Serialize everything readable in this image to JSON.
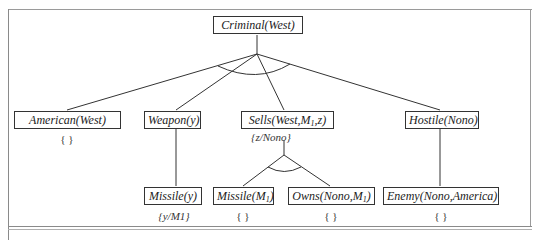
{
  "diagram": {
    "type": "proof-tree",
    "root": {
      "label": "Criminal(West)"
    },
    "level1": [
      {
        "label": "American(West)",
        "substitution": "{ }"
      },
      {
        "label": "Weapon(y)",
        "substitution": ""
      },
      {
        "label_main": "Sells(West,M",
        "label_sub": "1",
        "label_tail": ",z)",
        "substitution": "{z/Nono}"
      },
      {
        "label": "Hostile(Nono)",
        "substitution": ""
      }
    ],
    "level2": [
      {
        "parent": "Weapon(y)",
        "label": "Missile(y)",
        "substitution": "{y/M1}"
      },
      {
        "parent": "Sells(West,M1,z)",
        "label_main": "Missile(M",
        "label_sub": "1",
        "label_tail": ")",
        "substitution": "{ }"
      },
      {
        "parent": "Sells(West,M1,z)",
        "label_main": "Owns(Nono,M",
        "label_sub": "1",
        "label_tail": ")",
        "substitution": "{ }"
      },
      {
        "parent": "Hostile(Nono)",
        "label": "Enemy(Nono,America)",
        "substitution": "{ }"
      }
    ],
    "and_arcs": [
      "root-conjunction",
      "sells-conjunction"
    ]
  },
  "colors": {
    "line": "#333333",
    "frame": "#9a9a9a",
    "background": "#ffffff"
  }
}
